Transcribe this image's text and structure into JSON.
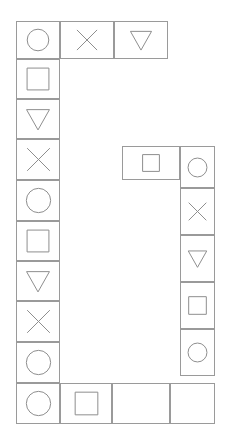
{
  "board": {
    "width": 230,
    "height": 446,
    "background_color": "#ffffff",
    "cell_border_color": "#9a9a9a",
    "glyph_stroke_color": "#8e8e8e",
    "shape_glyphs": {
      "circle": "circle-icon",
      "square": "square-icon",
      "triangle": "triangle-down-icon",
      "cross": "cross-icon",
      "blank": "blank-icon"
    },
    "cells": [
      {
        "id": "cell-top-1",
        "shape": "circle",
        "x": 16,
        "y": 21,
        "w": 44,
        "h": 38
      },
      {
        "id": "cell-top-2",
        "shape": "cross",
        "x": 60,
        "y": 21,
        "w": 54,
        "h": 38
      },
      {
        "id": "cell-top-3",
        "shape": "triangle",
        "x": 114,
        "y": 21,
        "w": 54,
        "h": 38
      },
      {
        "id": "cell-left-1",
        "shape": "square",
        "x": 16,
        "y": 59,
        "w": 44,
        "h": 40
      },
      {
        "id": "cell-left-2",
        "shape": "triangle",
        "x": 16,
        "y": 99,
        "w": 44,
        "h": 40
      },
      {
        "id": "cell-left-3",
        "shape": "cross",
        "x": 16,
        "y": 139,
        "w": 44,
        "h": 41
      },
      {
        "id": "cell-left-4",
        "shape": "circle",
        "x": 16,
        "y": 180,
        "w": 44,
        "h": 41
      },
      {
        "id": "cell-left-5",
        "shape": "square",
        "x": 16,
        "y": 221,
        "w": 44,
        "h": 40
      },
      {
        "id": "cell-left-6",
        "shape": "triangle",
        "x": 16,
        "y": 261,
        "w": 44,
        "h": 40
      },
      {
        "id": "cell-left-7",
        "shape": "cross",
        "x": 16,
        "y": 301,
        "w": 44,
        "h": 41
      },
      {
        "id": "cell-left-8",
        "shape": "circle",
        "x": 16,
        "y": 342,
        "w": 44,
        "h": 41
      },
      {
        "id": "cell-bottom-1",
        "shape": "circle",
        "x": 16,
        "y": 383,
        "w": 44,
        "h": 41
      },
      {
        "id": "cell-bottom-2",
        "shape": "square",
        "x": 60,
        "y": 383,
        "w": 52,
        "h": 41
      },
      {
        "id": "cell-bottom-3",
        "shape": "blank",
        "x": 112,
        "y": 383,
        "w": 58,
        "h": 41
      },
      {
        "id": "cell-bottom-4",
        "shape": "blank",
        "x": 170,
        "y": 383,
        "w": 45,
        "h": 41
      },
      {
        "id": "cell-mid-1",
        "shape": "square",
        "x": 122,
        "y": 146,
        "w": 58,
        "h": 34
      },
      {
        "id": "cell-right-1",
        "shape": "circle",
        "x": 180,
        "y": 146,
        "w": 35,
        "h": 42
      },
      {
        "id": "cell-right-2",
        "shape": "cross",
        "x": 180,
        "y": 188,
        "w": 35,
        "h": 47
      },
      {
        "id": "cell-right-3",
        "shape": "triangle",
        "x": 180,
        "y": 235,
        "w": 35,
        "h": 47
      },
      {
        "id": "cell-right-4",
        "shape": "square",
        "x": 180,
        "y": 282,
        "w": 35,
        "h": 47
      },
      {
        "id": "cell-right-5",
        "shape": "circle",
        "x": 180,
        "y": 329,
        "w": 35,
        "h": 47
      }
    ]
  }
}
